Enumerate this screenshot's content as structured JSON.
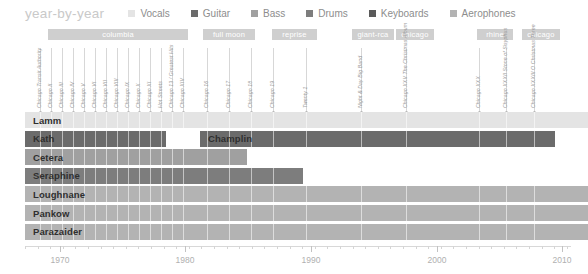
{
  "title": "year-by-year",
  "colors": {
    "vocals": "#e4e4e4",
    "guitar": "#6b6b6b",
    "bass": "#a0a0a0",
    "drums": "#7d7d7d",
    "keyboards": "#5a5a5a",
    "aerophones": "#b3b3b3",
    "label_chip": "#cfcfcf",
    "axis": "#d5d5d5",
    "tick_text": "#b0b0b0",
    "title_text": "#c9c9c9",
    "legend_text": "#8d8d8d",
    "album_stem": "#d7d7d7",
    "album_text": "#9a9a9a",
    "row_text": "#2f2f2f"
  },
  "legend": [
    {
      "label": "Vocals",
      "key": "vocals"
    },
    {
      "label": "Guitar",
      "key": "guitar"
    },
    {
      "label": "Bass",
      "key": "bass"
    },
    {
      "label": "Drums",
      "key": "drums"
    },
    {
      "label": "Keyboards",
      "key": "keyboards"
    },
    {
      "label": "Aerophones",
      "key": "aerophones"
    }
  ],
  "record_labels": [
    {
      "name": "columbia",
      "x": 48,
      "w": 140
    },
    {
      "name": "full moon",
      "x": 203,
      "w": 52
    },
    {
      "name": "reprise",
      "x": 272,
      "w": 45
    },
    {
      "name": "giant-rca",
      "x": 352,
      "w": 42
    },
    {
      "name": "chicago",
      "x": 396,
      "w": 38
    },
    {
      "name": "rhine",
      "x": 477,
      "w": 36
    },
    {
      "name": "chicago",
      "x": 522,
      "w": 38
    }
  ],
  "albums": [
    {
      "title": "Chicago Transit Authority",
      "x": 40
    },
    {
      "title": "Chicago II",
      "x": 51
    },
    {
      "title": "Chicago III",
      "x": 62
    },
    {
      "title": "Chicago IV",
      "x": 73
    },
    {
      "title": "Chicago V",
      "x": 84
    },
    {
      "title": "Chicago VI",
      "x": 95
    },
    {
      "title": "Chicago VII",
      "x": 106
    },
    {
      "title": "Chicago VIII",
      "x": 117
    },
    {
      "title": "Chicago IX",
      "x": 128
    },
    {
      "title": "Chicago X",
      "x": 139
    },
    {
      "title": "Chicago XI",
      "x": 150
    },
    {
      "title": "Hot Streets",
      "x": 161
    },
    {
      "title": "Chicago 13 / Greatest Hits",
      "x": 172
    },
    {
      "title": "Chicago XIV",
      "x": 183
    },
    {
      "title": "Chicago 16",
      "x": 207
    },
    {
      "title": "Chicago 17",
      "x": 229
    },
    {
      "title": "Chicago 18",
      "x": 251
    },
    {
      "title": "Chicago 19",
      "x": 273
    },
    {
      "title": "Twenty 1",
      "x": 306
    },
    {
      "title": "Night & Day Big Band",
      "x": 361
    },
    {
      "title": "Chicago XXV The Christmas Album",
      "x": 406
    },
    {
      "title": "Chicago XXX",
      "x": 479
    },
    {
      "title": "Chicago XXXII Stone of Sisyphus",
      "x": 506
    },
    {
      "title": "Chicago XXXIII O Christmas Three",
      "x": 534
    }
  ],
  "members": [
    {
      "name": "Lamm",
      "segments": [
        {
          "x": 25,
          "w": 563,
          "color_key": "vocals"
        }
      ]
    },
    {
      "name": "Kath",
      "segments": [
        {
          "x": 25,
          "w": 141,
          "color_key": "guitar"
        },
        {
          "x": 200,
          "w": 355,
          "color_key": "guitar"
        }
      ],
      "second_name": "Champlin",
      "second_name_x": 200
    },
    {
      "name": "Cetera",
      "segments": [
        {
          "x": 25,
          "w": 222,
          "color_key": "bass"
        }
      ]
    },
    {
      "name": "Seraphine",
      "segments": [
        {
          "x": 25,
          "w": 278,
          "color_key": "drums"
        }
      ]
    },
    {
      "name": "Loughnane",
      "segments": [
        {
          "x": 25,
          "w": 563,
          "color_key": "aerophones"
        }
      ]
    },
    {
      "name": "Pankow",
      "segments": [
        {
          "x": 25,
          "w": 563,
          "color_key": "aerophones"
        }
      ]
    },
    {
      "name": "Parazaider",
      "segments": [
        {
          "x": 25,
          "w": 563,
          "color_key": "aerophones"
        }
      ]
    }
  ],
  "axis": {
    "labels": [
      {
        "text": "1970",
        "x": 60
      },
      {
        "text": "1980",
        "x": 185
      },
      {
        "text": "1990",
        "x": 311
      },
      {
        "text": "2000",
        "x": 437
      },
      {
        "text": "2010",
        "x": 562
      }
    ],
    "start_x": 25,
    "end_x": 571,
    "minor_step": 12.6,
    "major_xs": [
      60,
      185,
      311,
      437,
      562
    ]
  },
  "chart_data": {
    "type": "bar",
    "title": "year-by-year",
    "xlabel": "",
    "ylabel": "",
    "xlim": [
      1967.2,
      2011.5
    ],
    "grid": true,
    "legend_position": "top",
    "categories": [
      "Lamm",
      "Kath",
      "Champlin",
      "Cetera",
      "Seraphine",
      "Loughnane",
      "Pankow",
      "Parazaider"
    ],
    "series": [
      {
        "name": "Lamm",
        "instrument": "Vocals",
        "start": 1967,
        "end": 2011
      },
      {
        "name": "Kath",
        "instrument": "Guitar",
        "start": 1967,
        "end": 1978
      },
      {
        "name": "Champlin",
        "instrument": "Guitar",
        "start": 1981,
        "end": 2009
      },
      {
        "name": "Cetera",
        "instrument": "Bass",
        "start": 1967,
        "end": 1985
      },
      {
        "name": "Seraphine",
        "instrument": "Drums",
        "start": 1967,
        "end": 1990
      },
      {
        "name": "Loughnane",
        "instrument": "Aerophones",
        "start": 1967,
        "end": 2011
      },
      {
        "name": "Pankow",
        "instrument": "Aerophones",
        "start": 1967,
        "end": 2011
      },
      {
        "name": "Parazaider",
        "instrument": "Aerophones",
        "start": 1967,
        "end": 2011
      }
    ],
    "tick_labels": [
      "1970",
      "1980",
      "1990",
      "2000",
      "2010"
    ],
    "annotations": {
      "record_labels": [
        "columbia",
        "full moon",
        "reprise",
        "giant-rca",
        "chicago",
        "rhine",
        "chicago"
      ],
      "albums": [
        "Chicago Transit Authority",
        "Chicago II",
        "Chicago III",
        "Chicago IV",
        "Chicago V",
        "Chicago VI",
        "Chicago VII",
        "Chicago VIII",
        "Chicago IX",
        "Chicago X",
        "Chicago XI",
        "Hot Streets",
        "Chicago 13 / Greatest Hits",
        "Chicago XIV",
        "Chicago 16",
        "Chicago 17",
        "Chicago 18",
        "Chicago 19",
        "Twenty 1",
        "Night & Day Big Band",
        "Chicago XXV The Christmas Album",
        "Chicago XXX",
        "Chicago XXXII Stone of Sisyphus",
        "Chicago XXXIII O Christmas Three"
      ]
    }
  }
}
